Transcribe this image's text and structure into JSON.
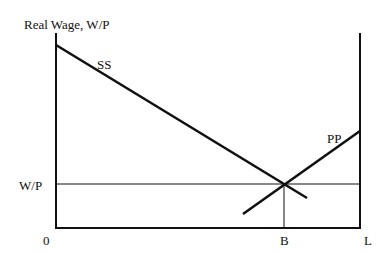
{
  "diagram": {
    "y_axis_label": "Real Wage, W/P",
    "curves": [
      {
        "name": "SS",
        "label": "SS",
        "from": [
          56,
          45
        ],
        "to": [
          307,
          198
        ]
      },
      {
        "name": "PP",
        "label": "PP",
        "from": [
          243,
          214
        ],
        "to": [
          360,
          131
        ]
      }
    ],
    "equilibrium": {
      "wage_label": "W/P",
      "employment_label": "B"
    },
    "origin_label": "0",
    "labor_force_label": "L",
    "colors": {
      "line": "#111111",
      "background": "#ffffff"
    }
  }
}
